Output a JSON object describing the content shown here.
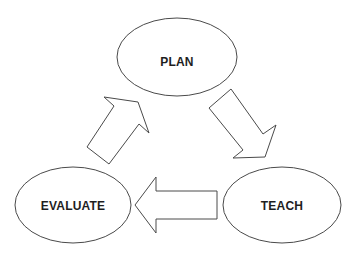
{
  "diagram": {
    "type": "cycle",
    "nodes": [
      {
        "id": "plan",
        "label": "PLAN",
        "cx": 177,
        "cy": 57,
        "rx": 60,
        "ry": 39
      },
      {
        "id": "teach",
        "label": "TEACH",
        "cx": 282,
        "cy": 205,
        "rx": 59,
        "ry": 38
      },
      {
        "id": "evaluate",
        "label": "EVALUATE",
        "cx": 73,
        "cy": 205,
        "rx": 58,
        "ry": 38
      }
    ],
    "edges": [
      {
        "from": "plan",
        "to": "teach",
        "style": "block-arrow"
      },
      {
        "from": "teach",
        "to": "evaluate",
        "style": "block-arrow"
      },
      {
        "from": "evaluate",
        "to": "plan",
        "style": "block-arrow"
      }
    ],
    "colors": {
      "stroke": "#4a4a4a",
      "fill": "#ffffff",
      "text": "#1e1e1e"
    }
  }
}
